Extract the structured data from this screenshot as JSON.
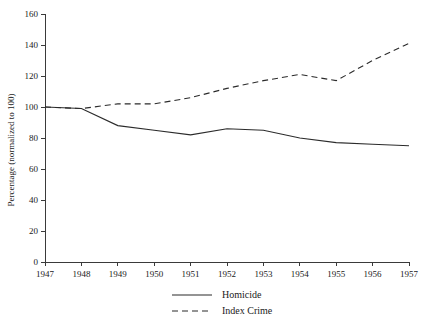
{
  "chart_data": {
    "type": "line",
    "title": "",
    "xlabel": "",
    "ylabel": "Percentage (normalized to 100)",
    "x": [
      1947,
      1948,
      1949,
      1950,
      1951,
      1952,
      1953,
      1954,
      1955,
      1956,
      1957
    ],
    "xticklabels": [
      "1947",
      "1948",
      "1949",
      "1950",
      "1951",
      "1952",
      "1953",
      "1954",
      "1955",
      "1956",
      "1957"
    ],
    "yticks": [
      0,
      20,
      40,
      60,
      80,
      100,
      120,
      140,
      160
    ],
    "yticklabels": [
      "0",
      "20",
      "40",
      "60",
      "80",
      "100",
      "120",
      "140",
      "160"
    ],
    "ylim": [
      0,
      160
    ],
    "xlim": [
      1947,
      1957
    ],
    "grid": false,
    "legend_position": "bottom-center",
    "series": [
      {
        "name": "Homicide",
        "style": "solid",
        "color": "#2b2b2b",
        "values": [
          100,
          99,
          88,
          85,
          82,
          86,
          85,
          80,
          77,
          76,
          75
        ]
      },
      {
        "name": "Index Crime",
        "style": "dashed",
        "color": "#2b2b2b",
        "values": [
          100,
          99,
          102,
          102,
          106,
          112,
          117,
          121,
          117,
          130,
          141
        ]
      }
    ]
  },
  "legend": {
    "items": [
      {
        "label": "Homicide",
        "style": "solid"
      },
      {
        "label": "Index Crime",
        "style": "dashed"
      }
    ]
  }
}
